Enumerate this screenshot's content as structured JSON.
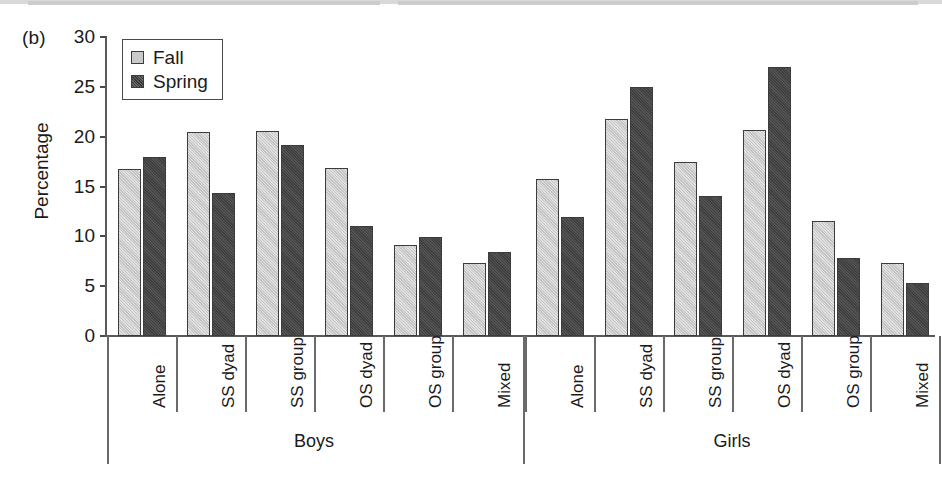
{
  "panel": {
    "label": "(b)"
  },
  "legend": {
    "items": [
      {
        "label": "Fall",
        "color": "#c9c9c9"
      },
      {
        "label": "Spring",
        "color": "#474747"
      }
    ]
  },
  "axes": {
    "y": {
      "title": "Percentage",
      "ticks": [
        "0",
        "5",
        "10",
        "15",
        "20",
        "25",
        "30"
      ],
      "min": 0,
      "max": 30
    }
  },
  "groups": [
    {
      "name": "Boys"
    },
    {
      "name": "Girls"
    }
  ],
  "chart_data": {
    "type": "bar",
    "title": "",
    "xlabel": "",
    "ylabel": "Percentage",
    "ylim": [
      0,
      30
    ],
    "grid": false,
    "legend_position": "top-left",
    "categories": [
      "Boys / Alone",
      "Boys / SS dyad",
      "Boys / SS group",
      "Boys / OS dyad",
      "Boys / OS group",
      "Boys / Mixed",
      "Girls / Alone",
      "Girls / SS dyad",
      "Girls / SS group",
      "Girls / OS dyad",
      "Girls / OS group",
      "Girls / Mixed"
    ],
    "category_labels": [
      "Alone",
      "SS dyad",
      "SS group",
      "OS dyad",
      "OS group",
      "Mixed",
      "Alone",
      "SS dyad",
      "SS group",
      "OS dyad",
      "OS group",
      "Mixed"
    ],
    "series": [
      {
        "name": "Fall",
        "color": "#c9c9c9",
        "values": [
          16.8,
          20.5,
          20.6,
          16.9,
          9.1,
          7.3,
          15.8,
          21.8,
          17.5,
          20.7,
          11.5,
          7.3
        ]
      },
      {
        "name": "Spring",
        "color": "#474747",
        "values": [
          18.0,
          14.3,
          19.2,
          11.0,
          9.9,
          8.4,
          11.9,
          25.0,
          14.0,
          27.0,
          7.8,
          5.3
        ]
      }
    ]
  }
}
